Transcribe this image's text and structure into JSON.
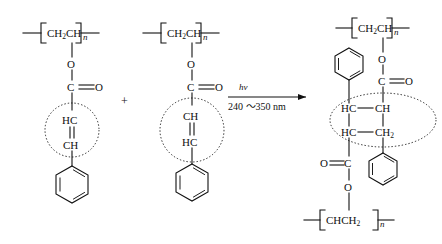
{
  "diagram": {
    "type": "chemical-reaction-scheme",
    "background_color": "#ffffff",
    "line_color": "#111111"
  },
  "reactant_left": {
    "name": "poly(vinyl cinnamate) repeat unit",
    "backbone_label": "CH",
    "backbone_sub": "2",
    "backbone_label2": "CH",
    "repeat_index": "n",
    "ester_o": "O",
    "carbonyl_c": "C",
    "carbonyl_o": "O",
    "vinyl_top": "HC",
    "vinyl_bottom": "CH",
    "ring": "benzene"
  },
  "plus_sign": "+",
  "reactant_right": {
    "name": "poly(vinyl cinnamate) repeat unit",
    "backbone_label": "CH",
    "backbone_sub": "2",
    "backbone_label2": "CH",
    "repeat_index": "n",
    "ester_o": "O",
    "carbonyl_c": "C",
    "carbonyl_o": "O",
    "vinyl_top": "CH",
    "vinyl_bottom": "HC",
    "ring": "benzene"
  },
  "arrow": {
    "above_label": "hν",
    "below_label": "240 ～350 nm",
    "direction": "right"
  },
  "product": {
    "name": "cyclobutane cross-linked product",
    "top_backbone_label": "CH",
    "top_backbone_sub": "2",
    "top_backbone_label2": "CH",
    "top_repeat_index": "n",
    "top_ester_o": "O",
    "top_carbonyl_c": "C",
    "top_carbonyl_o": "O",
    "cyclobutane_tl": "HC",
    "cyclobutane_tr": "CH",
    "cyclobutane_bl": "HC",
    "cyclobutane_br": "CH",
    "cyclobutane_br_sub": "2",
    "bottom_carbonyl_o": "O",
    "bottom_carbonyl_c": "C",
    "bottom_ester_o": "O",
    "bottom_backbone_label": "CHCH",
    "bottom_backbone_sub": "2",
    "bottom_repeat_index": "n",
    "ring_upper": "benzene",
    "ring_lower": "benzene"
  }
}
